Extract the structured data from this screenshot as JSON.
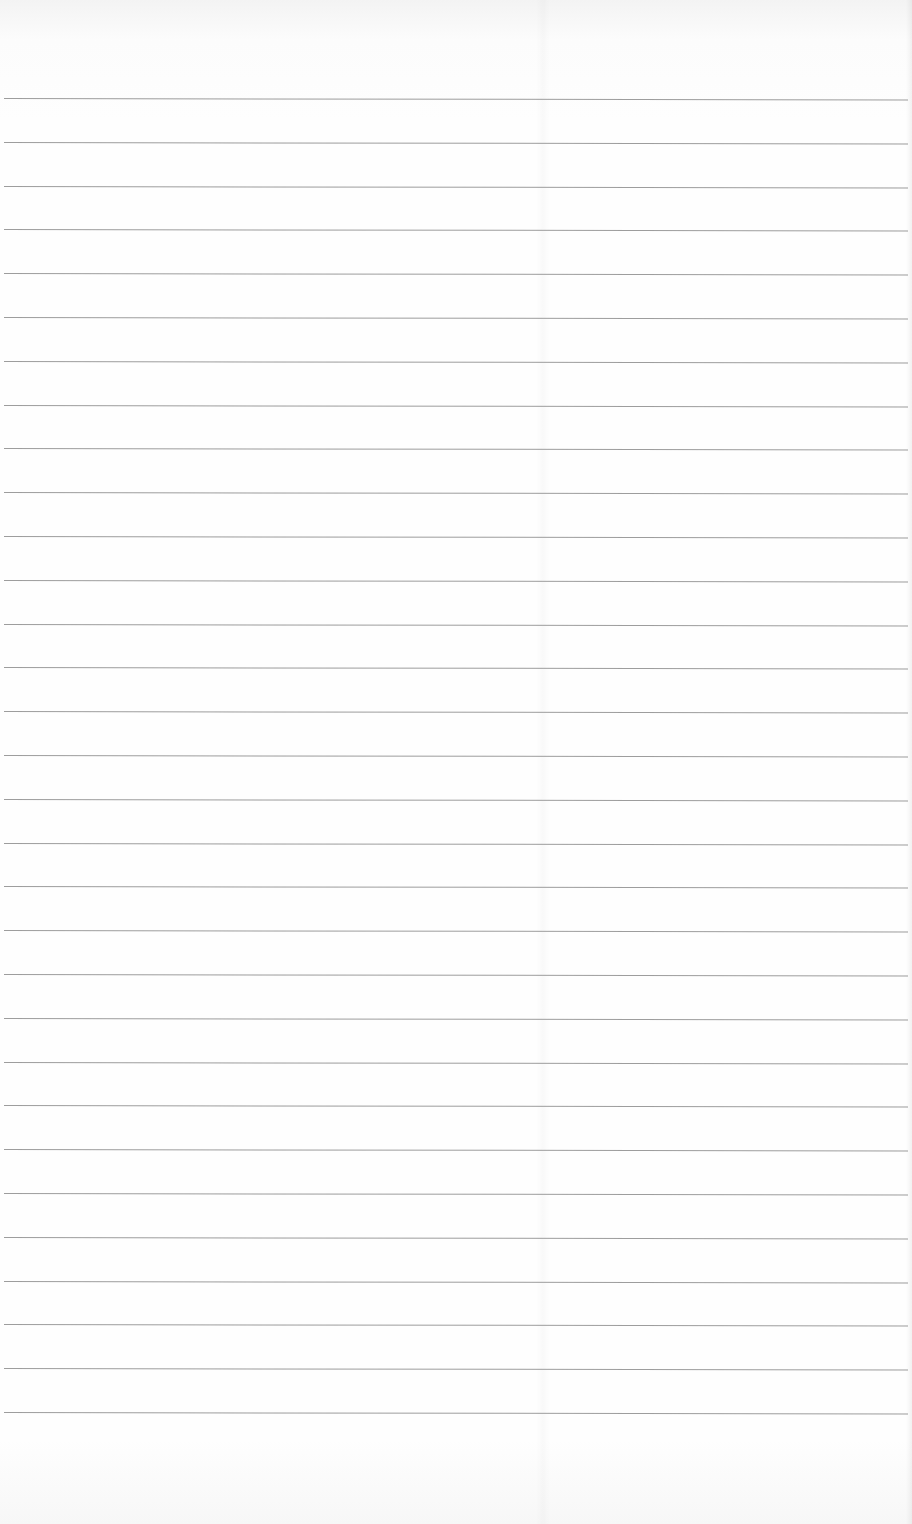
{
  "page": {
    "type": "ruled-notepad-sheet",
    "background_color": "#fdfdfd",
    "line_color": "#8c8c8c",
    "line_count": 31,
    "first_line_y": 98,
    "line_spacing_px": 43.8,
    "content_text": ""
  }
}
